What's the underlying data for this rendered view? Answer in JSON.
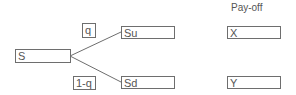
{
  "diagram": {
    "header": {
      "payoff_label": "Pay-off"
    },
    "nodes": {
      "root": {
        "label": "S"
      },
      "up": {
        "label": "Su"
      },
      "down": {
        "label": "Sd"
      },
      "payoff_up": {
        "label": "X"
      },
      "payoff_down": {
        "label": "Y"
      }
    },
    "probabilities": {
      "up": {
        "label": "q"
      },
      "down": {
        "label": "1-q"
      }
    },
    "colors": {
      "stroke": "#6e6e6e",
      "text": "#555555",
      "background": "#ffffff"
    }
  }
}
